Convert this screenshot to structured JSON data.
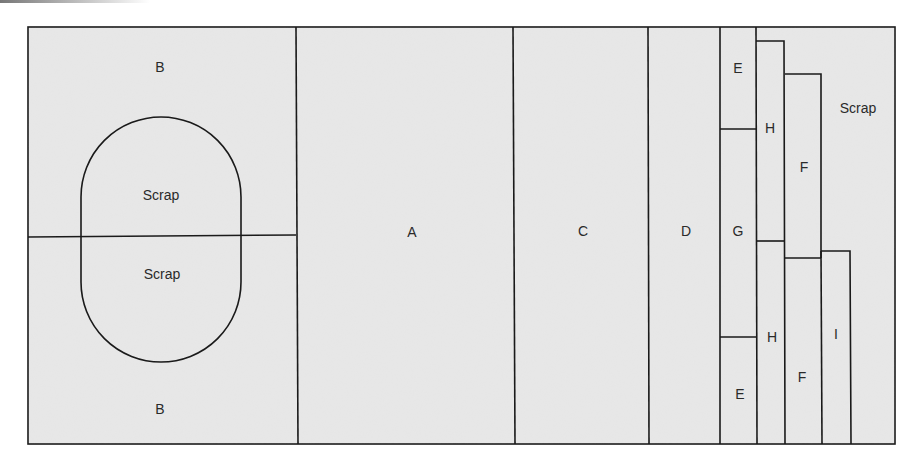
{
  "diagram": {
    "type": "cutting-layout",
    "board": {
      "x": 28,
      "y": 27,
      "width": 867,
      "height": 417,
      "fill": "#e8e8e8",
      "stroke": "#1a1a1a"
    },
    "colors": {
      "panel_fill": "#e8e8e8",
      "line": "#1a1a1a",
      "text": "#2a2a2a",
      "background": "#ffffff"
    },
    "pieces": [
      {
        "id": "B-top",
        "label": "B",
        "x": 28,
        "y": 27,
        "width": 268,
        "height": 208
      },
      {
        "id": "B-bottom",
        "label": "B",
        "x": 30,
        "y": 235,
        "width": 268,
        "height": 209
      },
      {
        "id": "A",
        "label": "A",
        "x": 296,
        "y": 27,
        "width": 217,
        "height": 417
      },
      {
        "id": "C",
        "label": "C",
        "x": 513,
        "y": 27,
        "width": 135,
        "height": 417
      },
      {
        "id": "D",
        "label": "D",
        "x": 648,
        "y": 27,
        "width": 72,
        "height": 417
      },
      {
        "id": "E-top",
        "label": "E",
        "x": 720,
        "y": 27,
        "width": 36,
        "height": 102
      },
      {
        "id": "G",
        "label": "G",
        "x": 720,
        "y": 129,
        "width": 36,
        "height": 208
      },
      {
        "id": "E-bottom",
        "label": "E",
        "x": 720,
        "y": 337,
        "width": 36,
        "height": 107
      },
      {
        "id": "H-top",
        "label": "H",
        "x": 756,
        "y": 41,
        "width": 29,
        "height": 200
      },
      {
        "id": "H-bottom",
        "label": "H",
        "x": 756,
        "y": 241,
        "width": 29,
        "height": 203
      },
      {
        "id": "F-top",
        "label": "F",
        "x": 785,
        "y": 74,
        "width": 36,
        "height": 184
      },
      {
        "id": "F-bottom",
        "label": "F",
        "x": 785,
        "y": 258,
        "width": 36,
        "height": 186
      },
      {
        "id": "I",
        "label": "I",
        "x": 821,
        "y": 251,
        "width": 30,
        "height": 193
      }
    ],
    "scrap_regions": [
      {
        "id": "scrap-oval-top",
        "label": "Scrap"
      },
      {
        "id": "scrap-oval-bottom",
        "label": "Scrap"
      },
      {
        "id": "scrap-right",
        "label": "Scrap"
      }
    ],
    "labels": {
      "b_top": "B",
      "b_bottom": "B",
      "scrap_top": "Scrap",
      "scrap_bottom": "Scrap",
      "a": "A",
      "c": "C",
      "d": "D",
      "e_top": "E",
      "g": "G",
      "e_bottom": "E",
      "h_top": "H",
      "h_bottom": "H",
      "f_top": "F",
      "f_bottom": "F",
      "i": "I",
      "scrap_right": "Scrap"
    }
  }
}
